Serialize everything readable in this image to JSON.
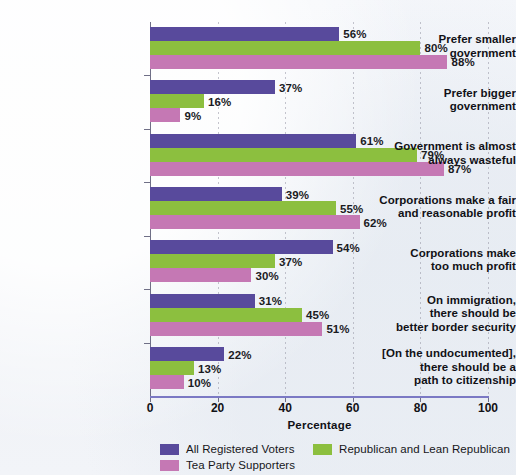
{
  "chart_data": {
    "type": "bar",
    "orientation": "horizontal",
    "title": "",
    "xlabel": "Percentage",
    "ylabel": "",
    "xlim": [
      0,
      100
    ],
    "xticks": [
      "0",
      "20",
      "40",
      "60",
      "80",
      "100"
    ],
    "grid": "vertical-dotted",
    "legend_position": "bottom",
    "categories": [
      "Prefer smaller government",
      "Prefer bigger government",
      "Government is almost always wasteful",
      "Corporations make a fair and reasonable profit",
      "Corporations make too much profit",
      "On immigration, there should be better border security",
      "[On the undocumented], there should be a path to citizenship"
    ],
    "category_lines": [
      [
        "Prefer smaller",
        "government"
      ],
      [
        "Prefer bigger",
        "government"
      ],
      [
        "Government is almost",
        "always wasteful"
      ],
      [
        "Corporations make a fair",
        "and reasonable profit"
      ],
      [
        "Corporations make",
        "too much profit"
      ],
      [
        "On immigration,",
        "there should be",
        "better border security"
      ],
      [
        "[On the undocumented],",
        "there should be a",
        "path to citizenship"
      ]
    ],
    "series": [
      {
        "name": "All Registered Voters",
        "color": "#584a9c",
        "values": [
          56,
          37,
          61,
          39,
          54,
          31,
          22
        ],
        "labels": [
          "56%",
          "37%",
          "61%",
          "39%",
          "54%",
          "31%",
          "22%"
        ]
      },
      {
        "name": "Republican and Lean Republican",
        "color": "#8cbf3f",
        "values": [
          80,
          16,
          79,
          55,
          37,
          45,
          13
        ],
        "labels": [
          "80%",
          "16%",
          "79%",
          "55%",
          "37%",
          "45%",
          "13%"
        ]
      },
      {
        "name": "Tea Party Supporters",
        "color": "#c578b4",
        "values": [
          88,
          9,
          87,
          62,
          30,
          51,
          10
        ],
        "labels": [
          "88%",
          "9%",
          "87%",
          "62%",
          "30%",
          "51%",
          "10%"
        ]
      }
    ]
  }
}
